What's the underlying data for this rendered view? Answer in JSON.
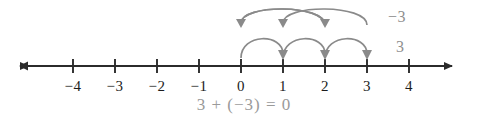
{
  "figure": {
    "equation": "3 + (−3) = 0",
    "axis": {
      "line_color": "#2b2b2b",
      "tick_color": "#2b2b2b",
      "label_color": "#1c1c1c",
      "left_arrow": "left-arrowhead",
      "right_arrow": "right-arrowhead",
      "min_shown": -4,
      "max_shown": 4
    },
    "ticks": [
      {
        "value": -4,
        "label": "−4"
      },
      {
        "value": -3,
        "label": "−3"
      },
      {
        "value": -2,
        "label": "−2"
      },
      {
        "value": -1,
        "label": "−1"
      },
      {
        "value": 0,
        "label": "0"
      },
      {
        "value": 1,
        "label": "1"
      },
      {
        "value": 2,
        "label": "2"
      },
      {
        "value": 3,
        "label": "3"
      },
      {
        "value": 4,
        "label": "4"
      }
    ],
    "jumps": {
      "arc_color": "#8a8a8a",
      "label_color": "#8f8f8f",
      "lower": {
        "label": "3",
        "direction": "right",
        "start": 0,
        "end": 3,
        "hops": [
          {
            "from": 0,
            "to": 1
          },
          {
            "from": 1,
            "to": 2
          },
          {
            "from": 2,
            "to": 3
          }
        ]
      },
      "upper": {
        "label": "−3",
        "direction": "left",
        "start": 3,
        "end": 0,
        "hops": [
          {
            "from": 3,
            "to": 2
          },
          {
            "from": 2,
            "to": 1
          },
          {
            "from": 1,
            "to": 0
          }
        ]
      }
    }
  }
}
